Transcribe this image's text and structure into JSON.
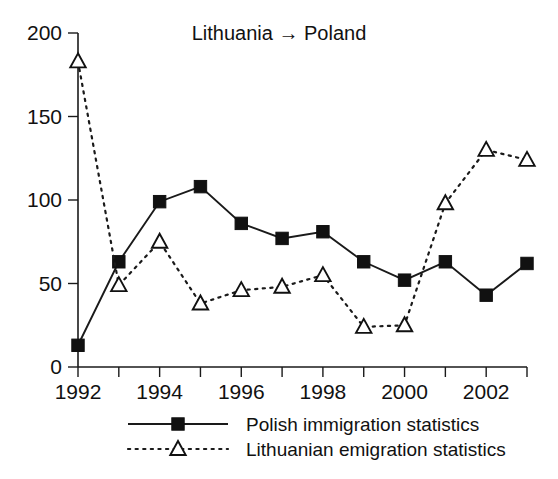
{
  "chart_data": {
    "type": "line",
    "title": "Lithuania → Poland",
    "xlabel": "",
    "ylabel": "",
    "x": [
      1992,
      1993,
      1994,
      1995,
      1996,
      1997,
      1998,
      1999,
      2000,
      2001,
      2002,
      2003
    ],
    "categories": [
      "1992",
      "1993",
      "1994",
      "1995",
      "1996",
      "1997",
      "1998",
      "1999",
      "2000",
      "2001",
      "2002",
      "2003"
    ],
    "xtick_labels": [
      "1992",
      "1994",
      "1996",
      "1998",
      "2000",
      "2002"
    ],
    "xtick_values": [
      1992,
      1994,
      1996,
      1998,
      2000,
      2002
    ],
    "ytick_labels": [
      "0",
      "50",
      "100",
      "150",
      "200"
    ],
    "ytick_values": [
      0,
      50,
      100,
      150,
      200
    ],
    "xlim": [
      1992,
      2003
    ],
    "ylim": [
      0,
      200
    ],
    "grid": false,
    "legend_position": "bottom",
    "series": [
      {
        "name": "Polish immigration statistics",
        "marker": "filled-square",
        "linestyle": "solid",
        "color": "#111111",
        "values": [
          13,
          63,
          99,
          108,
          86,
          77,
          81,
          63,
          52,
          63,
          43,
          62
        ]
      },
      {
        "name": "Lithuanian emigration statistics",
        "marker": "open-triangle",
        "linestyle": "dotted",
        "color": "#111111",
        "values": [
          183,
          49,
          75,
          38,
          46,
          48,
          55,
          24,
          25,
          98,
          130,
          124
        ]
      }
    ]
  },
  "legend": {
    "items": [
      {
        "label": "Polish immigration statistics",
        "style": "solid-square"
      },
      {
        "label": "Lithuanian emigration statistics",
        "style": "dotted-triangle"
      }
    ]
  },
  "colors": {
    "ink": "#111111",
    "background": "#ffffff"
  }
}
